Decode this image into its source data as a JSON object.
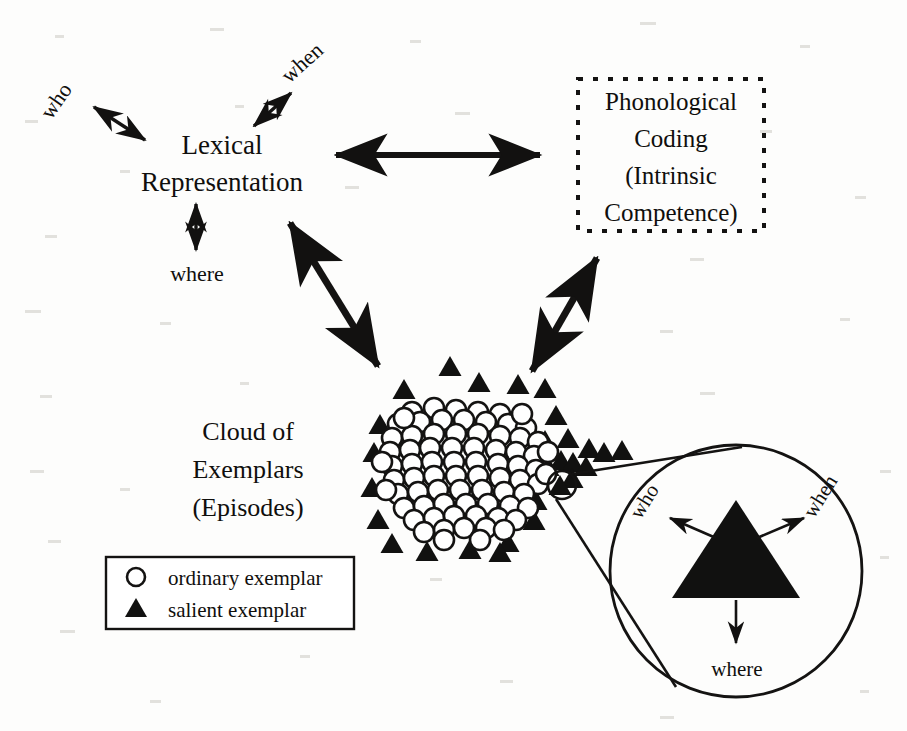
{
  "figure": {
    "type": "conceptual-diagram",
    "background_color": "#fdfdfc",
    "ink_color": "#111110"
  },
  "nodes": {
    "lexical": {
      "name": "lexical-representation",
      "line1": "Lexical",
      "line2": "Representation",
      "border": "none"
    },
    "phonological": {
      "name": "phonological-coding",
      "line1": "Phonological",
      "line2": "Coding",
      "line3": "(Intrinsic",
      "line4": "Competence)",
      "border": "dotted"
    },
    "cloud": {
      "name": "cloud-of-exemplars",
      "line1": "Cloud of",
      "line2": "Exemplars",
      "line3": "(Episodes)"
    }
  },
  "lexical_roles": [
    {
      "label": "who",
      "rotation_deg": -55,
      "arrow": "double"
    },
    {
      "label": "when",
      "rotation_deg": -42,
      "arrow": "double"
    },
    {
      "label": "where",
      "rotation_deg": 0,
      "arrow": "double"
    }
  ],
  "inset_roles": [
    {
      "label": "who",
      "rotation_deg": -58,
      "arrow": "single"
    },
    {
      "label": "when",
      "rotation_deg": -58,
      "arrow": "single"
    },
    {
      "label": "where",
      "rotation_deg": 0,
      "arrow": "single"
    }
  ],
  "connectors": [
    {
      "name": "lexical-to-phonological",
      "style": "double-headed",
      "orientation": "horizontal"
    },
    {
      "name": "lexical-to-cloud",
      "style": "double-headed",
      "orientation": "diagonal-down-right"
    },
    {
      "name": "phonological-to-cloud",
      "style": "double-headed",
      "orientation": "diagonal-down-left"
    }
  ],
  "legend": {
    "name": "exemplar-legend",
    "items": [
      {
        "symbol": "open-circle",
        "label": "ordinary exemplar"
      },
      {
        "symbol": "filled-triangle",
        "label": "salient exemplar"
      }
    ]
  },
  "magnifier": {
    "name": "exemplar-magnifier",
    "callout_shape": "circle",
    "source_marker": "salient exemplar",
    "magnified_symbol": "filled-triangle"
  },
  "chart_data": {
    "type": "scatter",
    "title": "Cloud of Exemplars (Episodes)",
    "series": [
      {
        "name": "ordinary exemplar",
        "marker": "open-circle",
        "count": 78,
        "points": [
          [
            412,
            412
          ],
          [
            434,
            408
          ],
          [
            456,
            410
          ],
          [
            478,
            412
          ],
          [
            500,
            414
          ],
          [
            398,
            424
          ],
          [
            420,
            422
          ],
          [
            442,
            420
          ],
          [
            464,
            420
          ],
          [
            486,
            422
          ],
          [
            508,
            424
          ],
          [
            526,
            428
          ],
          [
            392,
            438
          ],
          [
            412,
            436
          ],
          [
            434,
            434
          ],
          [
            456,
            434
          ],
          [
            478,
            434
          ],
          [
            500,
            436
          ],
          [
            520,
            438
          ],
          [
            538,
            442
          ],
          [
            390,
            452
          ],
          [
            410,
            450
          ],
          [
            430,
            448
          ],
          [
            452,
            448
          ],
          [
            474,
            448
          ],
          [
            496,
            450
          ],
          [
            516,
            452
          ],
          [
            534,
            456
          ],
          [
            392,
            466
          ],
          [
            412,
            464
          ],
          [
            432,
            462
          ],
          [
            454,
            462
          ],
          [
            476,
            462
          ],
          [
            498,
            464
          ],
          [
            518,
            466
          ],
          [
            536,
            470
          ],
          [
            394,
            480
          ],
          [
            414,
            478
          ],
          [
            434,
            476
          ],
          [
            456,
            476
          ],
          [
            478,
            476
          ],
          [
            500,
            478
          ],
          [
            520,
            480
          ],
          [
            538,
            484
          ],
          [
            398,
            494
          ],
          [
            418,
            492
          ],
          [
            438,
            490
          ],
          [
            460,
            490
          ],
          [
            482,
            490
          ],
          [
            504,
            492
          ],
          [
            524,
            494
          ],
          [
            404,
            508
          ],
          [
            424,
            506
          ],
          [
            444,
            504
          ],
          [
            466,
            504
          ],
          [
            488,
            504
          ],
          [
            510,
            506
          ],
          [
            528,
            508
          ],
          [
            414,
            520
          ],
          [
            434,
            518
          ],
          [
            454,
            516
          ],
          [
            476,
            516
          ],
          [
            498,
            518
          ],
          [
            516,
            520
          ],
          [
            424,
            532
          ],
          [
            444,
            530
          ],
          [
            464,
            528
          ],
          [
            486,
            528
          ],
          [
            504,
            530
          ],
          [
            404,
            418
          ],
          [
            522,
            414
          ],
          [
            382,
            462
          ],
          [
            548,
            452
          ],
          [
            386,
            490
          ],
          [
            546,
            474
          ],
          [
            444,
            540
          ],
          [
            480,
            540
          ]
        ]
      },
      {
        "name": "salient exemplar",
        "marker": "filled-triangle",
        "count": 30,
        "points": [
          [
            450,
            366
          ],
          [
            404,
            389
          ],
          [
            479,
            382
          ],
          [
            518,
            384
          ],
          [
            545,
            388
          ],
          [
            380,
            424
          ],
          [
            374,
            452
          ],
          [
            372,
            487
          ],
          [
            378,
            519
          ],
          [
            392,
            543
          ],
          [
            427,
            551
          ],
          [
            470,
            549
          ],
          [
            508,
            542
          ],
          [
            534,
            520
          ],
          [
            556,
            415
          ],
          [
            568,
            438
          ],
          [
            589,
            448
          ],
          [
            604,
            452
          ],
          [
            622,
            450
          ],
          [
            561,
            460
          ],
          [
            573,
            462
          ],
          [
            586,
            466
          ],
          [
            572,
            478
          ],
          [
            560,
            485
          ],
          [
            548,
            466
          ],
          [
            545,
            440
          ],
          [
            536,
            500
          ],
          [
            523,
            418
          ],
          [
            500,
            552
          ]
        ]
      }
    ],
    "xlabel": "",
    "ylabel": "",
    "grid": false,
    "legend_position": "lower-left"
  }
}
